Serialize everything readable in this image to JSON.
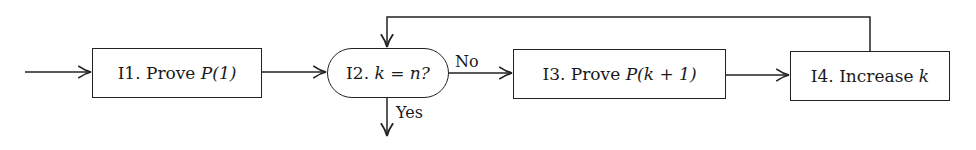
{
  "diagram": {
    "type": "flowchart",
    "nodes": [
      {
        "id": "I1",
        "prefix": "I1.",
        "text": "Prove",
        "math": "P(1)",
        "shape": "rectangle"
      },
      {
        "id": "I2",
        "prefix": "I2.",
        "text": "",
        "math": "k = n?",
        "shape": "rounded"
      },
      {
        "id": "I3",
        "prefix": "I3.",
        "text": "Prove",
        "math": "P(k + 1)",
        "shape": "rectangle"
      },
      {
        "id": "I4",
        "prefix": "I4.",
        "text": "Increase",
        "math": "k",
        "shape": "rectangle"
      }
    ],
    "edges": [
      {
        "from": "start",
        "to": "I1",
        "label": ""
      },
      {
        "from": "I1",
        "to": "I2",
        "label": ""
      },
      {
        "from": "I2",
        "to": "I3",
        "label": "No"
      },
      {
        "from": "I3",
        "to": "I4",
        "label": ""
      },
      {
        "from": "I4",
        "to": "I2",
        "label": "",
        "route": "loop-over-top"
      },
      {
        "from": "I2",
        "to": "exit",
        "label": "Yes"
      }
    ],
    "labels": {
      "no": "No",
      "yes": "Yes"
    },
    "colors": {
      "stroke": "#222222",
      "background": "#ffffff"
    }
  }
}
